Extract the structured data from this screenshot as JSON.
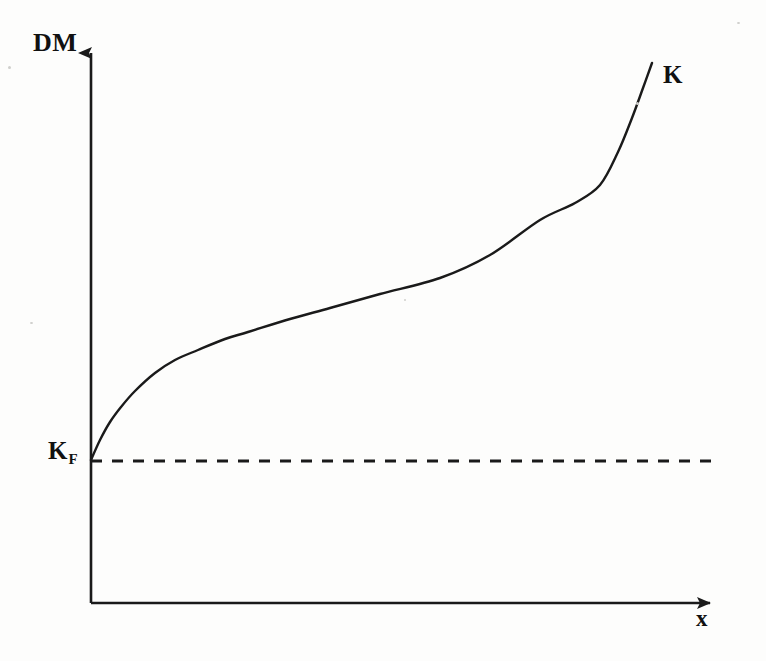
{
  "figure": {
    "background_color": "#fdfdfc",
    "ink_color": "#1a1a1a",
    "labels": {
      "y_axis": "DM",
      "x_axis": "x",
      "curve": "K",
      "baseline_main": "K",
      "baseline_sub": "F"
    }
  },
  "chart_data": {
    "type": "line",
    "title": "",
    "subtitle": "",
    "xlabel": "x",
    "ylabel": "DM",
    "grid": false,
    "legend_position": "inline-right-end",
    "axis_style": "arrow-headed open axes (no tick marks, no numeric scale)",
    "xlim": [
      0,
      1
    ],
    "ylim": [
      0,
      1
    ],
    "x_tick_labels": [],
    "y_tick_labels": [
      "K_F"
    ],
    "annotations": [
      {
        "name": "curve-end-label",
        "text": "K",
        "x": 0.89,
        "y": 0.74
      },
      {
        "name": "baseline-intercept-label",
        "text": "K_F",
        "x": 0.0,
        "y": 0.26
      }
    ],
    "series": [
      {
        "name": "K",
        "style": "solid",
        "description": "Monotonically increasing S-shaped (sigmoid-like) curve rising from K_F at the vertical axis, flattening through the middle range, then steepening sharply near the right end.",
        "points": [
          {
            "px": 91,
            "py": 460
          },
          {
            "px": 100,
            "py": 440
          },
          {
            "px": 110,
            "py": 422
          },
          {
            "px": 121,
            "py": 407
          },
          {
            "px": 135,
            "py": 391
          },
          {
            "px": 155,
            "py": 373
          },
          {
            "px": 175,
            "py": 360
          },
          {
            "px": 198,
            "py": 350
          },
          {
            "px": 225,
            "py": 339
          },
          {
            "px": 248,
            "py": 332
          },
          {
            "px": 290,
            "py": 319
          },
          {
            "px": 330,
            "py": 308
          },
          {
            "px": 380,
            "py": 294
          },
          {
            "px": 440,
            "py": 278
          },
          {
            "px": 490,
            "py": 255
          },
          {
            "px": 540,
            "py": 220
          },
          {
            "px": 575,
            "py": 203
          },
          {
            "px": 600,
            "py": 185
          },
          {
            "px": 618,
            "py": 152
          },
          {
            "px": 632,
            "py": 118
          },
          {
            "px": 643,
            "py": 88
          },
          {
            "px": 652,
            "py": 63
          }
        ]
      },
      {
        "name": "K_F",
        "style": "dashed",
        "description": "Horizontal dashed reference line at the level K_F, extending from the vertical axis to the right.",
        "points": [
          {
            "px": 91,
            "py": 461
          },
          {
            "px": 712,
            "py": 461
          }
        ]
      }
    ],
    "axes_geometry": {
      "origin": {
        "px": 91,
        "py": 603
      },
      "y_axis_top": {
        "px": 91,
        "py": 39
      },
      "x_axis_right": {
        "px": 722,
        "py": 603
      }
    }
  }
}
